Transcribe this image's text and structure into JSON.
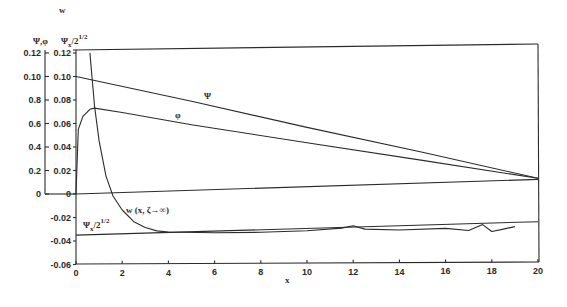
{
  "chart_data": {
    "type": "line",
    "title": "",
    "xlabel": "x",
    "ylabel_outer": "w",
    "ylabel_inner": "Ψ,φ  Ψx/2^1/2",
    "ylabel_lines": [
      "w",
      "Ψ,φ  Ψx/2^1/2"
    ],
    "xlim": [
      0,
      20
    ],
    "ylim_inner": [
      -0.06,
      0.12
    ],
    "ylim_outer": [
      0,
      1.2
    ],
    "x_ticks": [
      "0",
      "2",
      "4",
      "6",
      "8",
      "10",
      "12",
      "14",
      "16",
      "18",
      "20"
    ],
    "y_ticks_inner": [
      "0.12",
      "0.10",
      "0.08",
      "0.06",
      "0.04",
      "0.02",
      "0",
      "-0.02",
      "-0.04",
      "-0.06"
    ],
    "y_ticks_outer": [
      "0.12",
      "0.10",
      "0.8",
      "0.6",
      "0.4",
      "0.2",
      "0"
    ],
    "grid": false,
    "series": [
      {
        "name": "Ψ",
        "label": "Ψ",
        "x": [
          0,
          5,
          10,
          15,
          20
        ],
        "values": [
          0.1,
          0.078,
          0.055,
          0.033,
          0.01
        ]
      },
      {
        "name": "φ",
        "label": "φ",
        "x": [
          0,
          0.1,
          0.3,
          0.6,
          0.8,
          2,
          5,
          10,
          15,
          20
        ],
        "values": [
          0.0,
          0.055,
          0.066,
          0.072,
          0.073,
          0.069,
          0.058,
          0.042,
          0.026,
          0.01
        ]
      },
      {
        "name": "w (x, ζ→∞)",
        "label": "w (x, ζ→∞)",
        "axis": "outer",
        "x": [
          0.6,
          0.8,
          1.0,
          1.3,
          1.6,
          2.0,
          2.5,
          3.0,
          3.5,
          4.0,
          6,
          8,
          10,
          11.5,
          12,
          12.5,
          14,
          16,
          17,
          17.6,
          18,
          18.5,
          19
        ],
        "values": [
          0.12,
          0.075,
          0.045,
          0.015,
          -0.002,
          -0.014,
          -0.024,
          -0.029,
          -0.032,
          -0.033,
          -0.034,
          -0.034,
          -0.033,
          -0.031,
          -0.029,
          -0.032,
          -0.033,
          -0.032,
          -0.034,
          -0.029,
          -0.035,
          -0.033,
          -0.031
        ]
      },
      {
        "name": "Ψx/2^1/2",
        "label": "Ψx/2^1/2",
        "x": [
          0,
          20
        ],
        "values": [
          -0.035,
          -0.027
        ]
      },
      {
        "name": "zero line",
        "label": "",
        "x": [
          0,
          20
        ],
        "values": [
          0,
          0.009
        ]
      }
    ],
    "annotations": [
      "Ψ",
      "φ",
      "w (x, ζ→∞)",
      "Ψx/2^1/2"
    ]
  },
  "labels": {
    "ylabel_w": "w",
    "ylabel_psi_phi": "Ψ,φ",
    "ylabel_psix": "Ψ",
    "ylabel_psix_sub": "x",
    "ylabel_psix_denom": "/2",
    "ylabel_psix_sup": "1/2",
    "psi": "Ψ",
    "phi": "φ",
    "w_curve": "w (x, ζ→∞)",
    "psix_curve": "Ψ",
    "psix_curve_sub": "x",
    "psix_curve_denom": "/2",
    "psix_curve_sup": "1/2",
    "xlabel": "x"
  }
}
